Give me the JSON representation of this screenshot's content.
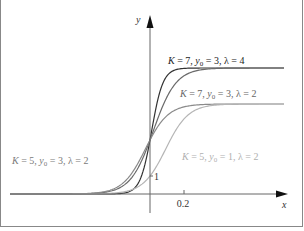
{
  "chart_data": {
    "type": "line",
    "title": "",
    "xlabel": "x",
    "ylabel": "y",
    "x_ticks": [
      {
        "value": 0.2,
        "label": "0.2"
      }
    ],
    "y_ticks": [
      {
        "value": 1,
        "label": "1"
      }
    ],
    "grid": false,
    "legend_position": "inline annotations",
    "series": [
      {
        "name": "K = 7, y0 = 3, λ = 4",
        "K": 7,
        "y0": 3,
        "lambda": 4,
        "color": "#333333",
        "label_prefix": "K = 7,  y",
        "label_sub": "0",
        "label_suffix": " = 3,  λ = 4"
      },
      {
        "name": "K = 7, y0 = 3, λ = 2",
        "K": 7,
        "y0": 3,
        "lambda": 2,
        "color": "#6a6a6a",
        "label_prefix": "K = 7,  y",
        "label_sub": "0",
        "label_suffix": " = 3,  λ = 2"
      },
      {
        "name": "K = 5, y0 = 3, λ = 2",
        "K": 5,
        "y0": 3,
        "lambda": 2,
        "color": "#8a8a8a",
        "label_prefix": "K = 5,  y",
        "label_sub": "0",
        "label_suffix": " = 3,  λ = 2"
      },
      {
        "name": "K = 5, y0 = 1, λ = 2",
        "K": 5,
        "y0": 1,
        "lambda": 2,
        "color": "#b5b5b5",
        "label_prefix": "K = 5,  y",
        "label_sub": "0",
        "label_suffix": " = 1,  λ = 2"
      }
    ]
  },
  "axes": {
    "x_label": "x",
    "y_label": "y",
    "tick_x": "0.2",
    "tick_y": "1"
  }
}
